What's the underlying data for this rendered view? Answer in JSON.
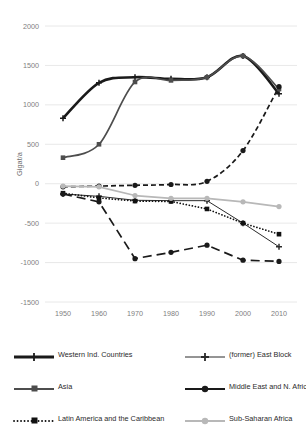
{
  "chart_data": {
    "type": "line",
    "title": "",
    "xlabel": "",
    "ylabel": "Gigat/a",
    "x": [
      1950,
      1960,
      1970,
      1980,
      1990,
      2000,
      2010
    ],
    "xticklabels": [
      "1950",
      "1960",
      "1970",
      "1980",
      "1990",
      "2000",
      "2010"
    ],
    "yticklabels": [
      "2000",
      "1500",
      "1000",
      "500",
      "0",
      "-500",
      "-1000",
      "-1500"
    ],
    "yticks": [
      2000,
      1500,
      1000,
      500,
      0,
      -500,
      -1000,
      -1500
    ],
    "ylim": [
      -1500,
      2000
    ],
    "xlim": [
      1945,
      2015
    ],
    "grid": true,
    "legend_position": "below",
    "series": [
      {
        "name": "Western Ind. Countries",
        "marker": "plus",
        "line_style": "solid",
        "line_width": "thick",
        "color": "#1a1a1a",
        "values": [
          830,
          1280,
          1350,
          1330,
          1350,
          1620,
          1140
        ]
      },
      {
        "name": "(former) East Block",
        "marker": "plus",
        "line_style": "solid",
        "line_width": "thin",
        "color": "#2b2b2b",
        "values": [
          -130,
          -160,
          -210,
          -215,
          -215,
          -500,
          -800
        ]
      },
      {
        "name": "Asia",
        "marker": "square",
        "line_style": "solid",
        "line_width": "medium",
        "color": "#4d4d4d",
        "values": [
          330,
          500,
          1290,
          1310,
          1350,
          1620,
          1200
        ]
      },
      {
        "name": "Middle East and N. Africa",
        "marker": "circle",
        "line_style": "dashed",
        "line_width": "medium",
        "color": "#1a1a1a",
        "values": [
          -40,
          -30,
          -20,
          -10,
          30,
          420,
          1230
        ]
      },
      {
        "name": "Latin America and the Caribbean",
        "marker": "square",
        "line_style": "dotted",
        "line_width": "medium",
        "color": "#111111",
        "values": [
          -120,
          -180,
          -220,
          -225,
          -320,
          -500,
          -640
        ]
      },
      {
        "name": "Sub-Saharan Africa",
        "marker": "circle",
        "line_style": "solid",
        "line_width": "medium",
        "color": "#b8b8b8",
        "values": [
          -30,
          -40,
          -150,
          -185,
          -185,
          -230,
          -290
        ]
      },
      {
        "name": "series-long-dash",
        "hidden_from_legend": true,
        "marker": "circle",
        "line_style": "longdash",
        "line_width": "medium",
        "color": "#1a1a1a",
        "values": [
          -130,
          -230,
          -950,
          -870,
          -780,
          -970,
          -985
        ]
      }
    ]
  },
  "legend": {
    "items": [
      {
        "label": "Western Ind. Countries",
        "marker": "plus",
        "style": "solid-thick",
        "color": "#1a1a1a"
      },
      {
        "label": "(former) East Block",
        "marker": "plus",
        "style": "solid-thin",
        "color": "#2b2b2b"
      },
      {
        "label": "Asia",
        "marker": "square",
        "style": "solid-medium",
        "color": "#4d4d4d"
      },
      {
        "label": "Middle East and N. Africa",
        "marker": "circle",
        "style": "solid-medium",
        "color": "#1a1a1a"
      },
      {
        "label": "Latin America and the Caribbean",
        "marker": "square",
        "style": "dotted",
        "color": "#111111"
      },
      {
        "label": "Sub-Saharan Africa",
        "marker": "circle",
        "style": "solid-light",
        "color": "#b8b8b8"
      }
    ]
  }
}
